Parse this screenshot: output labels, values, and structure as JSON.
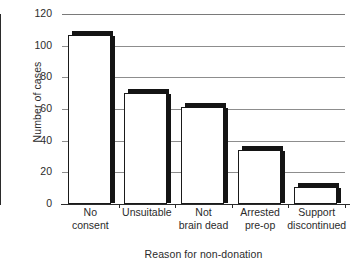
{
  "chart_data": {
    "type": "bar",
    "title": "",
    "subtitle": "",
    "xlabel": "Reason for non-donation",
    "ylabel": "Number of cases",
    "categories": [
      "No consent",
      "Unsuitable",
      "Not brain dead",
      "Arrested pre-op",
      "Support discontinued"
    ],
    "category_lines": [
      [
        "No",
        "consent"
      ],
      [
        "Unsuitable",
        ""
      ],
      [
        "Not",
        "brain dead"
      ],
      [
        "Arrested",
        "pre-op"
      ],
      [
        "Support",
        "discontinued"
      ]
    ],
    "values": [
      107,
      70,
      61,
      34,
      11
    ],
    "ylim": [
      0,
      120
    ],
    "ytick_labels": [
      "0",
      "20",
      "40",
      "60",
      "80",
      "100",
      "120"
    ],
    "ytick_values": [
      0,
      20,
      40,
      60,
      80,
      100,
      120
    ],
    "yminor_step": 5,
    "grid": "horizontal",
    "legend": "none",
    "bar_style": "3d-block-white-fill",
    "colors": {
      "bar_fill": "#ffffff",
      "bar_outline": "#1a1a1a",
      "bar_shadow": "#141414",
      "gridline": "#8d8d8d",
      "axis": "#2b2b2b",
      "text": "#2b2b2b",
      "background": "#ffffff"
    }
  }
}
